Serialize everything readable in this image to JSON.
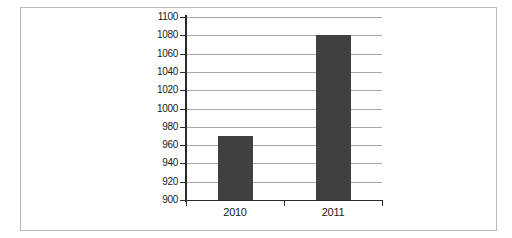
{
  "chart_data": {
    "type": "bar",
    "title": "",
    "subtitle": "",
    "xlabel": "",
    "ylabel": "Number of complaints",
    "categories": [
      "2010",
      "2011"
    ],
    "values": [
      970,
      1080
    ],
    "series": [
      {
        "name": "Number of complaints",
        "values": [
          970,
          1080
        ],
        "color": "#404040"
      }
    ],
    "ylim": [
      900,
      1100
    ],
    "ytick_step": 20,
    "ytick_labels": [
      "900",
      "920",
      "940",
      "960",
      "980",
      "1000",
      "1020",
      "1040",
      "1060",
      "1080",
      "1100"
    ],
    "ytick_values": [
      900,
      920,
      940,
      960,
      980,
      1000,
      1020,
      1040,
      1060,
      1080,
      1100
    ],
    "xtick_labels": [
      "2010",
      "2011"
    ],
    "grid": true,
    "grid_axis": "y",
    "legend": false,
    "legend_position": "none",
    "annotations": [],
    "colors": {
      "bar": "#404040",
      "gridline": "#a9a9a9",
      "axis": "#2b2b2b",
      "frame_border": "#b8b8b8",
      "background": "#ffffff",
      "text": "#1a1a1a"
    }
  }
}
